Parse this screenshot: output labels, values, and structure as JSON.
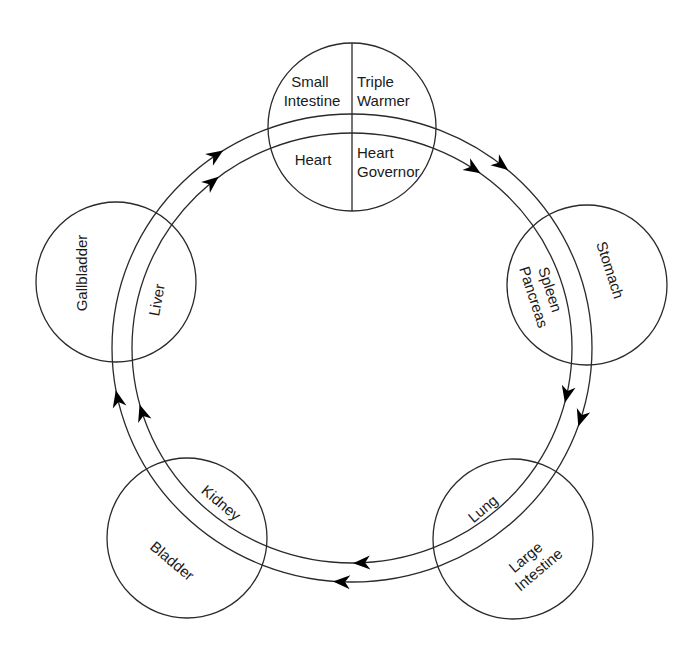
{
  "diagram": {
    "flow_direction": "clockwise",
    "elements": [
      {
        "id": "fire",
        "position": "top",
        "labels": {
          "outer_left": [
            "Small",
            "Intestine"
          ],
          "outer_right": [
            "Triple",
            "Warmer"
          ],
          "inner_left": [
            "Heart"
          ],
          "inner_right": [
            "Heart",
            "Governor"
          ]
        }
      },
      {
        "id": "earth",
        "position": "right",
        "labels": {
          "outer": [
            "Stomach"
          ],
          "inner": [
            "Spleen",
            "Pancreas"
          ]
        }
      },
      {
        "id": "metal",
        "position": "bottom-right",
        "labels": {
          "outer": [
            "Large",
            "Intestine"
          ],
          "inner": [
            "Lung"
          ]
        }
      },
      {
        "id": "water",
        "position": "bottom-left",
        "labels": {
          "outer": [
            "Bladder"
          ],
          "inner": [
            "Kidney"
          ]
        }
      },
      {
        "id": "wood",
        "position": "left",
        "labels": {
          "outer": [
            "Gallbladder"
          ],
          "inner": [
            "Liver"
          ]
        }
      }
    ],
    "arrows": [
      {
        "between": [
          "wood",
          "fire"
        ],
        "direction": "clockwise",
        "count": 2
      },
      {
        "between": [
          "fire",
          "earth"
        ],
        "direction": "clockwise",
        "count": 2
      },
      {
        "between": [
          "earth",
          "metal"
        ],
        "direction": "clockwise",
        "count": 2
      },
      {
        "between": [
          "metal",
          "water"
        ],
        "direction": "clockwise",
        "count": 2
      },
      {
        "between": [
          "water",
          "wood"
        ],
        "direction": "clockwise",
        "count": 2
      }
    ]
  }
}
